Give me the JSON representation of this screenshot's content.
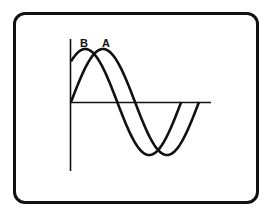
{
  "diagram": {
    "type": "phase-shifted sine waves",
    "labels": {
      "wave_b": "B",
      "wave_a": "A"
    },
    "colors": {
      "stroke": "#111111",
      "background": "#ffffff"
    }
  },
  "chart_data": {
    "type": "line",
    "title": "",
    "xlabel": "",
    "ylabel": "",
    "grid": false,
    "legend": "inline labels above peaks",
    "series": [
      {
        "name": "A",
        "description": "sine wave starting at zero",
        "phase_deg": 0,
        "cycles": 1,
        "amplitude": 1
      },
      {
        "name": "B",
        "description": "sine wave leading A by ~50 degrees",
        "phase_deg": 50,
        "cycles": 1,
        "amplitude": 1
      }
    ]
  }
}
